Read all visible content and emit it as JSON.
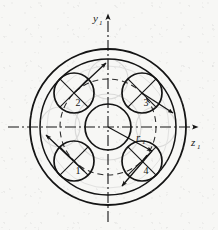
{
  "figure": {
    "background_color": "#f7f7f5",
    "line_color": "#141414",
    "ghost_color": "#b9b9b9"
  },
  "axes": {
    "vertical": {
      "label": "y",
      "subscript": "1",
      "name": "y1-axis",
      "direction": "up",
      "style": "dash-dot"
    },
    "horizontal": {
      "label": "z",
      "subscript": "1",
      "name": "z1-axis",
      "direction": "right",
      "style": "dash-dot"
    },
    "origin": {
      "cx": 108,
      "cy": 127
    }
  },
  "radius_marker": {
    "label": "r",
    "subscript": "1",
    "description": "pitch radius arrow from origin to planet pitch circle",
    "angle_deg": -28
  },
  "rings": [
    {
      "name": "outer-housing-circle",
      "r": 78,
      "stroke": 1.7
    },
    {
      "name": "inner-housing-circle",
      "r": 68,
      "stroke": 1.5
    },
    {
      "name": "pitch-circle-dashed",
      "r": 48,
      "stroke": 1.0,
      "style": "dashed"
    },
    {
      "name": "sun-outer-circle",
      "r": 33,
      "stroke": 1.0,
      "style": "ghost"
    },
    {
      "name": "sun-gear-circle",
      "r": 23,
      "stroke": 1.6
    }
  ],
  "planets": [
    {
      "id": "planet-1",
      "label": "1",
      "angle_deg": 225,
      "r": 20,
      "cx": 74,
      "cy": 161,
      "label_dx": 4,
      "label_dy": 13,
      "arrow_angle_deg": 225
    },
    {
      "id": "planet-2",
      "label": "2",
      "angle_deg": 135,
      "r": 20,
      "cx": 74,
      "cy": 93,
      "label_dx": 4,
      "label_dy": 13,
      "arrow_angle_deg": 45
    },
    {
      "id": "planet-3",
      "label": "3",
      "angle_deg": 45,
      "r": 20,
      "cx": 142,
      "cy": 93,
      "label_dx": 4,
      "label_dy": 13,
      "arrow_angle_deg": -25
    },
    {
      "id": "planet-4",
      "label": "4",
      "angle_deg": 315,
      "r": 20,
      "cx": 142,
      "cy": 161,
      "label_dx": 4,
      "label_dy": 13,
      "arrow_angle_deg": 215
    }
  ],
  "ghost_planets": [
    {
      "name": "ghost-planet-left",
      "cx": 60,
      "cy": 127,
      "r": 20
    },
    {
      "name": "ghost-planet-right",
      "cx": 156,
      "cy": 127,
      "r": 20
    },
    {
      "name": "ghost-planet-top",
      "cx": 108,
      "cy": 79,
      "r": 20
    }
  ]
}
